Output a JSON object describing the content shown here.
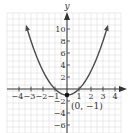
{
  "chart_data": {
    "type": "line",
    "title": "",
    "function": "y = x^2 - 1",
    "xlabel": "",
    "ylabel": "y",
    "xlim": [
      -5,
      5
    ],
    "ylim": [
      -7,
      12
    ],
    "grid": true,
    "x_ticks": [
      -4,
      -3,
      -2,
      -1,
      1,
      2,
      3,
      4
    ],
    "x_tick_labels": [
      "−4",
      "−3",
      "−2",
      "−1",
      "1",
      "2",
      "3",
      "4"
    ],
    "y_ticks": [
      10,
      8,
      6,
      4,
      2,
      -2,
      -4,
      -6
    ],
    "y_tick_labels": [
      "10",
      "8",
      "6",
      "4",
      "2",
      "−2",
      "−4",
      "−6"
    ],
    "series": [
      {
        "name": "parabola",
        "x": [
          -3.4,
          -3,
          -2.5,
          -2,
          -1.5,
          -1,
          -0.5,
          0,
          0.5,
          1,
          1.5,
          2,
          2.5,
          3,
          3.4
        ],
        "values": [
          10.56,
          8,
          5.25,
          3,
          1.25,
          0,
          -0.75,
          -1,
          -0.75,
          0,
          1.25,
          3,
          5.25,
          8,
          10.56
        ]
      }
    ],
    "annotations": [
      {
        "type": "point",
        "x": 0,
        "y": -1,
        "label": "(0, −1)"
      }
    ],
    "legend": null
  },
  "labels": {
    "y_axis": "y",
    "vertex": "(0, −1)",
    "x_ticks": [
      "−4",
      "−3",
      "−2",
      "−1",
      "1",
      "2",
      "3",
      "4"
    ],
    "y_ticks": [
      "10",
      "8",
      "6",
      "4",
      "2",
      "−2",
      "−4",
      "−6"
    ]
  },
  "colors": {
    "curve": "#4a4a4a",
    "axis": "#333333",
    "grid": "#d9d9d9",
    "point": "#111111"
  }
}
